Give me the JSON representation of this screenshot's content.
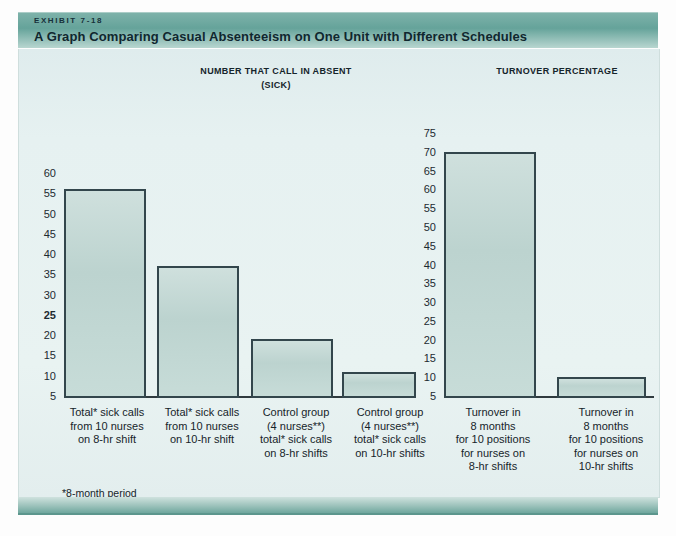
{
  "header": {
    "kicker": "EXHIBIT 7-18",
    "title": "A Graph Comparing Casual Absenteeism on One Unit with Different Schedules"
  },
  "sections": {
    "left_heading_line1": "NUMBER THAT CALL IN ABSENT",
    "left_heading_line2": "(SICK)",
    "right_heading": "TURNOVER PERCENTAGE"
  },
  "footnotes": {
    "one": "*8-month period",
    "two": "**Same nurses"
  },
  "axes": {
    "left_ticks": [
      "60",
      "55",
      "50",
      "45",
      "40",
      "35",
      "30",
      "25",
      "20",
      "15",
      "10",
      "5"
    ],
    "right_ticks": [
      "75",
      "70",
      "65",
      "60",
      "55",
      "50",
      "45",
      "40",
      "35",
      "30",
      "25",
      "20",
      "15",
      "10",
      "5"
    ]
  },
  "categories": [
    {
      "lines": [
        "Total* sick calls",
        "from 10 nurses",
        "on 8-hr shift"
      ]
    },
    {
      "lines": [
        "Total* sick calls",
        "from 10 nurses",
        "on 10-hr shift"
      ]
    },
    {
      "lines": [
        "Control group",
        "(4 nurses**)",
        "total* sick calls",
        "on 8-hr shifts"
      ]
    },
    {
      "lines": [
        "Control group",
        "(4 nurses**)",
        "total* sick calls",
        "on 10-hr shifts"
      ]
    },
    {
      "lines": [
        "Turnover in",
        "8 months",
        "for 10 positions",
        "for nurses on",
        "8-hr shifts"
      ]
    },
    {
      "lines": [
        "Turnover in",
        "8 months",
        "for 10 positions",
        "for nurses on",
        "10-hr shifts"
      ]
    }
  ],
  "colors": {
    "band": "#65a39a",
    "panel": "#e6f1f1",
    "bar_fill": "#c3d8d4",
    "bar_border": "#33464c",
    "text": "#16242a"
  },
  "chart_data": [
    {
      "type": "bar",
      "title": "NUMBER THAT CALL IN ABSENT (SICK)",
      "xlabel": "",
      "ylabel": "",
      "ylim": [
        0,
        62
      ],
      "grid": false,
      "yticks": [
        5,
        10,
        15,
        20,
        25,
        30,
        35,
        40,
        45,
        50,
        55,
        60
      ],
      "categories": [
        "Total* sick calls from 10 nurses on 8-hr shift",
        "Total* sick calls from 10 nurses on 10-hr shift",
        "Control group (4 nurses**) total* sick calls on 8-hr shifts",
        "Control group (4 nurses**) total* sick calls on 10-hr shifts"
      ],
      "values": [
        56,
        37,
        19,
        11
      ]
    },
    {
      "type": "bar",
      "title": "TURNOVER PERCENTAGE",
      "xlabel": "",
      "ylabel": "",
      "ylim": [
        0,
        77
      ],
      "grid": false,
      "yticks": [
        5,
        10,
        15,
        20,
        25,
        30,
        35,
        40,
        45,
        50,
        55,
        60,
        65,
        70,
        75
      ],
      "categories": [
        "Turnover in 8 months for 10 positions for nurses on 8-hr shifts",
        "Turnover in 8 months for 10 positions for nurses on 10-hr shifts"
      ],
      "values": [
        70,
        10
      ]
    }
  ]
}
